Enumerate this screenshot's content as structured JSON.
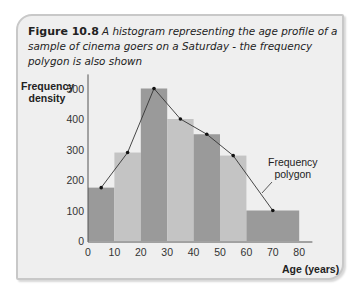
{
  "caption": {
    "figure_label": "Figure 10.8",
    "description": "A histogram representing the age profile of a sample of cinema goers on a Saturday - the frequency polygon is also shown"
  },
  "axes": {
    "ylabel_line1": "Frequency",
    "ylabel_line2": "density",
    "xlabel": "Age (years)"
  },
  "annotation": {
    "line1": "Frequency",
    "line2": "polygon"
  },
  "colors": {
    "panel_bg": "#efefef",
    "bar_dark": "#9a9a9a",
    "bar_light": "#c4c4c4",
    "line": "#333333"
  },
  "chart_data": {
    "type": "bar",
    "title": "Figure 10.8 A histogram representing the age profile of a sample of cinema goers on a Saturday - the frequency polygon is also shown",
    "xlabel": "Age (years)",
    "ylabel": "Frequency density",
    "bins": [
      {
        "from": 0,
        "to": 10,
        "value": 175
      },
      {
        "from": 10,
        "to": 20,
        "value": 290
      },
      {
        "from": 20,
        "to": 30,
        "value": 500
      },
      {
        "from": 30,
        "to": 40,
        "value": 400
      },
      {
        "from": 40,
        "to": 50,
        "value": 350
      },
      {
        "from": 50,
        "to": 60,
        "value": 280
      },
      {
        "from": 60,
        "to": 80,
        "value": 100
      }
    ],
    "categories": [
      "0-10",
      "10-20",
      "20-30",
      "30-40",
      "40-50",
      "50-60",
      "60-80"
    ],
    "values": [
      175,
      290,
      500,
      400,
      350,
      280,
      100
    ],
    "frequency_polygon": {
      "x": [
        5,
        15,
        25,
        35,
        45,
        55,
        70
      ],
      "y": [
        175,
        290,
        500,
        400,
        350,
        280,
        100
      ]
    },
    "xticks": [
      0,
      10,
      20,
      30,
      40,
      50,
      60,
      70,
      80
    ],
    "yticks": [
      0,
      100,
      200,
      300,
      400,
      500
    ],
    "xlim": [
      0,
      85
    ],
    "ylim": [
      0,
      520
    ],
    "grid": false,
    "annotations": [
      "Frequency polygon"
    ]
  }
}
